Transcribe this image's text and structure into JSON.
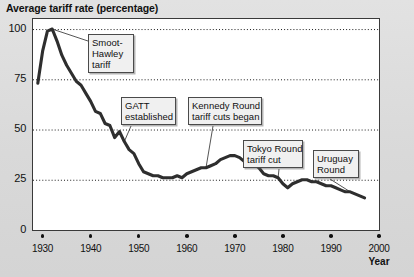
{
  "chart_data": {
    "type": "line",
    "title": "Average tariff rate (percentage)",
    "xlabel": "Year",
    "ylabel": "",
    "xlim": [
      1928,
      2000
    ],
    "ylim": [
      0,
      105
    ],
    "grid": "dotted-horizontal",
    "legend": "none",
    "yticks": [
      "0",
      "25",
      "50",
      "75",
      "100"
    ],
    "ytick_values": [
      0,
      25,
      50,
      75,
      100
    ],
    "xticks": [
      "1930",
      "1940",
      "1950",
      "1960",
      "1970",
      "1980",
      "1990",
      "2000"
    ],
    "xtick_values": [
      1930,
      1940,
      1950,
      1960,
      1970,
      1980,
      1990,
      2000
    ],
    "series": [
      {
        "name": "Average tariff rate",
        "color": "#2e2e2e",
        "x": [
          1929,
          1930,
          1931,
          1932,
          1933,
          1934,
          1935,
          1936,
          1937,
          1938,
          1939,
          1940,
          1941,
          1942,
          1943,
          1944,
          1945,
          1946,
          1947,
          1948,
          1949,
          1950,
          1951,
          1952,
          1953,
          1954,
          1955,
          1956,
          1957,
          1958,
          1959,
          1960,
          1961,
          1962,
          1963,
          1964,
          1965,
          1966,
          1967,
          1968,
          1969,
          1970,
          1971,
          1972,
          1973,
          1974,
          1975,
          1976,
          1977,
          1978,
          1979,
          1980,
          1981,
          1982,
          1983,
          1984,
          1985,
          1986,
          1987,
          1988,
          1989,
          1990,
          1991,
          1992,
          1993,
          1994,
          1995,
          1996,
          1997
        ],
        "values": [
          73,
          89,
          99,
          100,
          94,
          87,
          82,
          78,
          74,
          72,
          68,
          64,
          59,
          58,
          53,
          52,
          46,
          49,
          44,
          40,
          38,
          33,
          29,
          28,
          27,
          27,
          26,
          26,
          26,
          27,
          26,
          28,
          29,
          30,
          31,
          31,
          32,
          33,
          35,
          36,
          37,
          37,
          36,
          34,
          33,
          33,
          31,
          28,
          27,
          27,
          26,
          23,
          21,
          23,
          24,
          25,
          25,
          24,
          24,
          23,
          22,
          22,
          21,
          20,
          19,
          19,
          18,
          17,
          16
        ]
      }
    ],
    "annotations": [
      {
        "id": "smoot-hawley",
        "lines": [
          "Smoot-",
          "Hawley",
          "tariff"
        ],
        "target_x": 1932,
        "target_y": 100
      },
      {
        "id": "gatt-established",
        "lines": [
          "GATT",
          "established"
        ],
        "target_x": 1947,
        "target_y": 44
      },
      {
        "id": "kennedy-round",
        "lines": [
          "Kennedy Round",
          "tariff cuts began"
        ],
        "target_x": 1964,
        "target_y": 31
      },
      {
        "id": "tokyo-round",
        "lines": [
          "Tokyo Round",
          "tariff cut"
        ],
        "target_x": 1979,
        "target_y": 26
      },
      {
        "id": "uruguay-round",
        "lines": [
          "Uruguay",
          "Round"
        ],
        "target_x": 1994,
        "target_y": 19
      }
    ]
  }
}
